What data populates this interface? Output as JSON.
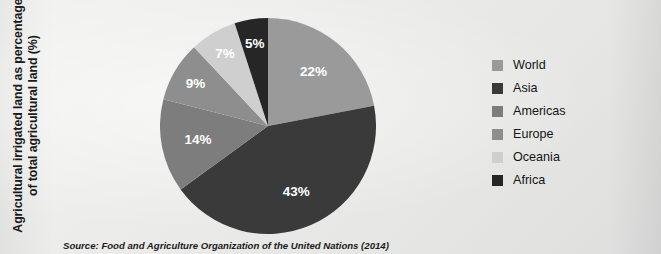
{
  "axis": {
    "label_line1": "Agricultural irrigated land as percentage",
    "label_line2": "of total agricultural land (%)"
  },
  "source": {
    "text": "Source: Food and Agriculture Organization of the United Nations (2014)"
  },
  "legend": {
    "items": [
      {
        "label": "World",
        "color": "#9a9a9a"
      },
      {
        "label": "Asia",
        "color": "#3a3a3a"
      },
      {
        "label": "Americas",
        "color": "#7d7d7d"
      },
      {
        "label": "Europe",
        "color": "#8e8e8e"
      },
      {
        "label": "Oceania",
        "color": "#cfcfcf"
      },
      {
        "label": "Africa",
        "color": "#262626"
      }
    ]
  },
  "slice_labels": {
    "world": "22%",
    "asia": "43%",
    "americas": "14%",
    "europe": "9%",
    "oceania": "7%",
    "africa": "5%"
  },
  "chart_data": {
    "type": "pie",
    "title": "",
    "ylabel": "Agricultural irrigated land as percentage of total agricultural land (%)",
    "xlabel": "",
    "categories": [
      "World",
      "Asia",
      "Americas",
      "Europe",
      "Oceania",
      "Africa"
    ],
    "values": [
      22,
      43,
      14,
      9,
      7,
      5
    ],
    "data_labels": [
      "22%",
      "43%",
      "14%",
      "9%",
      "7%",
      "5%"
    ],
    "colors": [
      "#9a9a9a",
      "#3a3a3a",
      "#7d7d7d",
      "#8e8e8e",
      "#cfcfcf",
      "#262626"
    ],
    "units": "percent",
    "start_angle_deg": 0,
    "direction": "clockwise",
    "legend_position": "right",
    "grid": false,
    "annotations": [
      "Source: Food and Agriculture Organization of the United Nations (2014)"
    ]
  }
}
